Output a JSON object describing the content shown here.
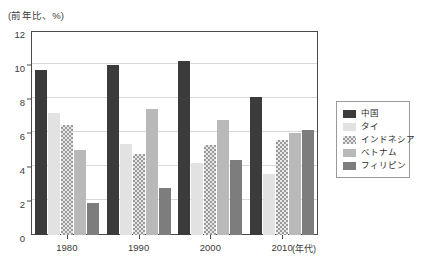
{
  "chart_data": {
    "type": "bar",
    "title": "",
    "unit_label": "(前年比、%)",
    "xlabel": "(年代)",
    "ylabel": "",
    "categories": [
      "1980",
      "1990",
      "2000",
      "2010"
    ],
    "ylim": [
      0,
      12
    ],
    "y_ticks": [
      0,
      2,
      4,
      6,
      8,
      10,
      12
    ],
    "grid": true,
    "legend_position": "right",
    "series": [
      {
        "name": "中国",
        "color": "#3b3b3b",
        "pattern": "solid",
        "values": [
          9.7,
          10.0,
          10.25,
          8.1
        ]
      },
      {
        "name": "タイ",
        "color": "#e2e2e2",
        "pattern": "solid",
        "values": [
          7.2,
          5.35,
          4.25,
          3.6
        ]
      },
      {
        "name": "インドネシア",
        "color": "#9a9a9a",
        "pattern": "checkered",
        "values": [
          6.5,
          4.75,
          5.3,
          5.6
        ]
      },
      {
        "name": "ベトナム",
        "color": "#b9b9b9",
        "pattern": "solid",
        "values": [
          5.0,
          7.4,
          6.75,
          6.0
        ]
      },
      {
        "name": "フィリピン",
        "color": "#7d7d7d",
        "pattern": "solid",
        "values": [
          1.9,
          2.75,
          4.4,
          6.2
        ]
      }
    ]
  },
  "axes": {
    "y_tick_labels": [
      "0",
      "2",
      "4",
      "6",
      "8",
      "10",
      "12"
    ],
    "x_tick_labels": [
      "1980",
      "1990",
      "2000",
      "2010"
    ],
    "x_axis_suffix": "(年代)"
  },
  "legend": {
    "items": [
      {
        "label": "中国"
      },
      {
        "label": "タイ"
      },
      {
        "label": "インドネシア"
      },
      {
        "label": "ベトナム"
      },
      {
        "label": "フィリピン"
      }
    ]
  }
}
